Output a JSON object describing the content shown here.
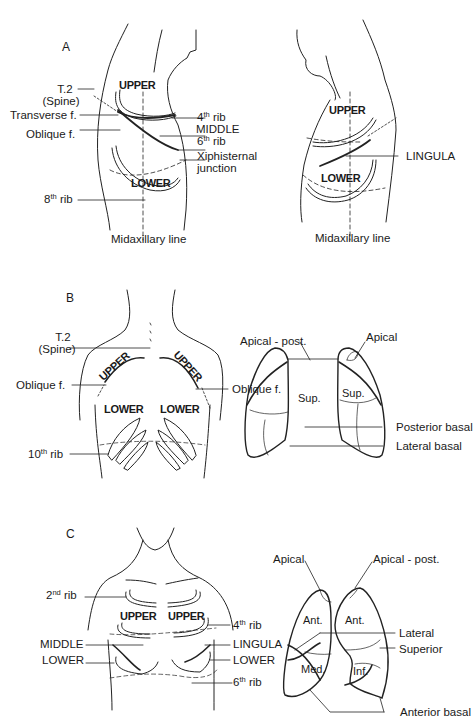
{
  "figure": {
    "panels": [
      {
        "id": "A",
        "letter": "A",
        "left_view": {
          "lobes": [
            "UPPER",
            "MIDDLE",
            "LOWER"
          ],
          "labels_left": [
            "T.2",
            "(Spine)",
            "Transverse f.",
            "Oblique f."
          ],
          "rib_8_base": "8",
          "rib_8_sup": "th",
          "rib_8_word": "rib",
          "rib_4_base": "4",
          "rib_4_sup": "th",
          "rib_4_word": "rib",
          "middle": "MIDDLE",
          "rib_6_base": "6",
          "rib_6_sup": "th",
          "rib_6_word": "rib",
          "xiphisternal_1": "Xiphisternal",
          "xiphisternal_2": "junction",
          "axis_label": "Midaxillary line",
          "upper": "UPPER",
          "lower": "LOWER"
        },
        "right_view": {
          "upper": "UPPER",
          "lower": "LOWER",
          "lingula": "LINGULA",
          "axis_label": "Midaxillary line"
        }
      },
      {
        "id": "B",
        "letter": "B",
        "back_view": {
          "t2_1": "T.2",
          "t2_2": "(Spine)",
          "oblique_left": "Oblique f.",
          "oblique_right": "Oblique f.",
          "rib_10_base": "10",
          "rib_10_sup": "th",
          "rib_10_word": "rib",
          "upper_left": "UPPER",
          "upper_right": "UPPER",
          "lower_left": "LOWER",
          "lower_right": "LOWER"
        },
        "lungs": {
          "apical_post": "Apical - post.",
          "apical": "Apical",
          "sup_left": "Sup.",
          "sup_right": "Sup.",
          "posterior_basal": "Posterior basal",
          "lateral_basal": "Lateral basal"
        }
      },
      {
        "id": "C",
        "letter": "C",
        "front_view": {
          "rib_2_base": "2",
          "rib_2_sup": "nd",
          "rib_2_word": "rib",
          "middle": "MIDDLE",
          "lower_left": "LOWER",
          "upper_left": "UPPER",
          "upper_right": "UPPER",
          "rib_4_base": "4",
          "rib_4_sup": "th",
          "rib_4_word": "rib",
          "lingula": "LINGULA",
          "lower_right": "LOWER",
          "rib_6_base": "6",
          "rib_6_sup": "th",
          "rib_6_word": "rib"
        },
        "lungs": {
          "apical": "Apical",
          "apical_post": "Apical - post.",
          "ant_left": "Ant.",
          "ant_right": "Ant.",
          "med": "Med.",
          "inf": "Inf.",
          "lateral": "Lateral",
          "superior": "Superior",
          "anterior_basal": "Anterior basal"
        }
      }
    ]
  }
}
